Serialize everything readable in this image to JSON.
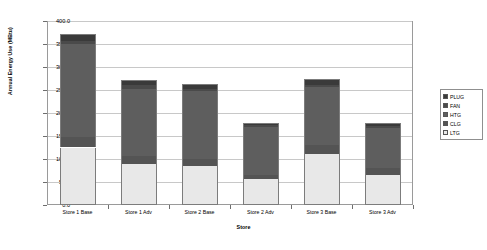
{
  "chart_data": {
    "type": "bar",
    "stacked": true,
    "title": "",
    "xlabel": "Store",
    "ylabel": "Annual Energy Use (MBtu)",
    "categories": [
      "Store 1 Base",
      "Store 1 Adv",
      "Store 2 Base",
      "Store 2 Adv",
      "Store 3 Base",
      "Store 3 Adv"
    ],
    "ylim": [
      0,
      400
    ],
    "yticks": [
      0.0,
      50.0,
      100.0,
      150.0,
      200.0,
      250.0,
      300.0,
      350.0,
      400.0
    ],
    "ytick_labels": [
      "0.0",
      "50.0",
      "100.0",
      "150.0",
      "200.0",
      "250.0",
      "300.0",
      "350.0",
      "400.0"
    ],
    "grid": true,
    "legend_position": "right",
    "series": [
      {
        "name": "LTG",
        "color": "#e8e8e8",
        "values": [
          125,
          90,
          85,
          57,
          110,
          65
        ]
      },
      {
        "name": "CLG",
        "color": "#545454",
        "values": [
          22,
          16,
          16,
          8,
          20,
          15
        ]
      },
      {
        "name": "HTG",
        "color": "#5e5e5e",
        "values": [
          203,
          146,
          146,
          105,
          127,
          88
        ]
      },
      {
        "name": "FAN",
        "color": "#4a4a4a",
        "values": [
          7,
          9,
          5,
          3,
          3,
          4
        ]
      },
      {
        "name": "PLUG",
        "color": "#3a3a3a",
        "values": [
          15,
          11,
          10,
          5,
          15,
          6
        ]
      }
    ],
    "totals": [
      372,
      272,
      262,
      178,
      275,
      178
    ]
  },
  "legend": {
    "items": [
      {
        "label": "PLUG",
        "color": "#3a3a3a"
      },
      {
        "label": "FAN",
        "color": "#4a4a4a"
      },
      {
        "label": "HTG",
        "color": "#5e5e5e"
      },
      {
        "label": "CLG",
        "color": "#545454"
      },
      {
        "label": "LTG",
        "color": "#e8e8e8"
      }
    ]
  }
}
